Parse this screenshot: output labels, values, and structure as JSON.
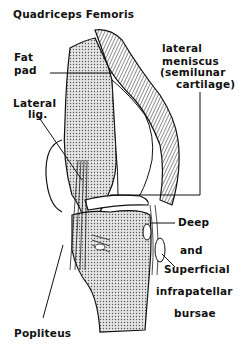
{
  "diagram": {
    "labels": {
      "quadriceps": "Quadriceps Femoris",
      "fat_pad_1": "Fat",
      "fat_pad_2": "pad",
      "lateral_lig_1": "Lateral",
      "lateral_lig_2": "lig.",
      "meniscus_1": "lateral",
      "meniscus_2": "meniscus",
      "meniscus_3": "(semilunar",
      "meniscus_4": "cartilage)",
      "deep": "Deep",
      "and": "and",
      "superficial": "Superficial",
      "infrapatellar": "infrapatellar",
      "bursae": "bursae",
      "popliteus": "Popliteus"
    },
    "colors": {
      "ink": "#111111",
      "bone_fill": "#c9c9c9",
      "background": "#ffffff"
    }
  }
}
